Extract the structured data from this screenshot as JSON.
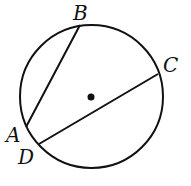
{
  "diagram": {
    "type": "circle-with-chords",
    "circle": {
      "cx": 91.5,
      "cy": 96.5,
      "r": 71.5,
      "stroke": "#111111"
    },
    "center_dot": {
      "cx": 91,
      "cy": 97,
      "r": 3.5
    },
    "points": [
      {
        "name": "B",
        "x": 80,
        "y": 25,
        "label_x": 73,
        "label_y": 20
      },
      {
        "name": "C",
        "x": 158,
        "y": 74,
        "label_x": 163,
        "label_y": 72
      },
      {
        "name": "A",
        "x": 26,
        "y": 127,
        "label_x": 6,
        "label_y": 142
      },
      {
        "name": "D",
        "x": 39,
        "y": 144,
        "label_x": 18,
        "label_y": 164
      }
    ],
    "chords": [
      {
        "name": "AB",
        "from": "A",
        "to": "B"
      },
      {
        "name": "DC",
        "from": "D",
        "to": "C"
      }
    ]
  }
}
